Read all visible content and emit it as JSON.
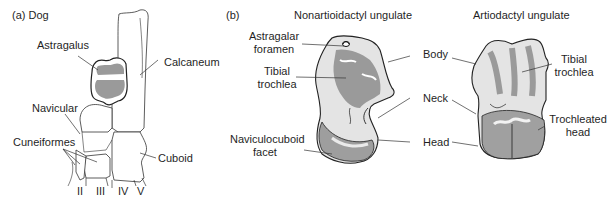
{
  "figure": {
    "panel_a": {
      "label": "(a) Dog",
      "structures": {
        "astragalus": "Astragalus",
        "calcaneum": "Calcaneum",
        "navicular": "Navicular",
        "cuneiformes": "Cuneiformes",
        "cuboid": "Cuboid"
      },
      "digits": [
        "II",
        "III",
        "IV",
        "V"
      ]
    },
    "panel_b": {
      "label": "(b)",
      "left_specimen": {
        "title": "Nonartioidactyl ungulate",
        "labels": {
          "astragalar_foramen_1": "Astragalar",
          "astragalar_foramen_2": "foramen",
          "tibial_trochlea_1": "Tibial",
          "tibial_trochlea_2": "trochlea",
          "naviculocuboid_1": "Naviculocuboid",
          "naviculocuboid_2": "facet"
        }
      },
      "shared_labels": {
        "body": "Body",
        "neck": "Neck",
        "head": "Head"
      },
      "right_specimen": {
        "title": "Artiodactyl ungulate",
        "labels": {
          "tibial_trochlea_1": "Tibial",
          "tibial_trochlea_2": "trochlea",
          "trochleated_head_1": "Trochleated",
          "trochleated_head_2": "head"
        }
      }
    },
    "colors": {
      "bone_shade": "#9a9a9a",
      "bone_light": "#e6e6e6",
      "outline": "#222222",
      "leader": "#333333"
    }
  }
}
